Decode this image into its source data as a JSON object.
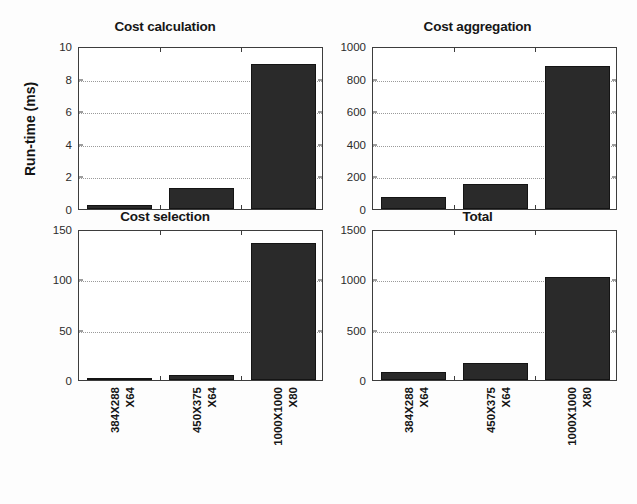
{
  "figure": {
    "background": "#fdfdfd",
    "bar_color": "#2a2a2a",
    "axis_color": "#3d3d3d",
    "grid_color": "#9a9a9a",
    "ylabel": "Run-time (ms)"
  },
  "chart_data": [
    {
      "type": "bar",
      "title": "Cost calculation",
      "categories": [
        "384X288 X64",
        "450X375 X64",
        "1000X1000 X80"
      ],
      "category_lines": [
        [
          "384X288",
          "X64"
        ],
        [
          "450X375",
          "X64"
        ],
        [
          "1000X1000",
          "X80"
        ]
      ],
      "values": [
        0.25,
        1.3,
        8.9
      ],
      "xlabel": "",
      "ylabel": "Run-time (ms)",
      "ylim": [
        0,
        10
      ],
      "yticks": [
        0,
        2,
        4,
        6,
        8,
        10
      ],
      "ytick_labels": [
        "0",
        "2",
        "4",
        "6",
        "8",
        "10"
      ],
      "grid": true,
      "legend": false,
      "show_xticklabels": false
    },
    {
      "type": "bar",
      "title": "Cost aggregation",
      "categories": [
        "384X288 X64",
        "450X375 X64",
        "1000X1000 X80"
      ],
      "category_lines": [
        [
          "384X288",
          "X64"
        ],
        [
          "450X375",
          "X64"
        ],
        [
          "1000X1000",
          "X80"
        ]
      ],
      "values": [
        75,
        155,
        875
      ],
      "xlabel": "",
      "ylabel": "",
      "ylim": [
        0,
        1000
      ],
      "yticks": [
        0,
        200,
        400,
        600,
        800,
        1000
      ],
      "ytick_labels": [
        "0",
        "200",
        "400",
        "600",
        "800",
        "1000"
      ],
      "grid": true,
      "legend": false,
      "show_xticklabels": false
    },
    {
      "type": "bar",
      "title": "Cost selection",
      "categories": [
        "384X288 X64",
        "450X375 X64",
        "1000X1000 X80"
      ],
      "category_lines": [
        [
          "384X288",
          "X64"
        ],
        [
          "450X375",
          "X64"
        ],
        [
          "1000X1000",
          "X80"
        ]
      ],
      "values": [
        1.5,
        5,
        136
      ],
      "xlabel": "",
      "ylabel": "",
      "ylim": [
        0,
        150
      ],
      "yticks": [
        0,
        50,
        100,
        150
      ],
      "ytick_labels": [
        "0",
        "50",
        "100",
        "150"
      ],
      "grid": true,
      "legend": false,
      "show_xticklabels": true
    },
    {
      "type": "bar",
      "title": "Total",
      "categories": [
        "384X288 X64",
        "450X375 X64",
        "1000X1000 X80"
      ],
      "category_lines": [
        [
          "384X288",
          "X64"
        ],
        [
          "450X375",
          "X64"
        ],
        [
          "1000X1000",
          "X80"
        ]
      ],
      "values": [
        75,
        165,
        1020
      ],
      "xlabel": "",
      "ylabel": "",
      "ylim": [
        0,
        1500
      ],
      "yticks": [
        0,
        500,
        1000,
        1500
      ],
      "ytick_labels": [
        "0",
        "500",
        "1000",
        "1500"
      ],
      "grid": true,
      "legend": false,
      "show_xticklabels": true
    }
  ]
}
